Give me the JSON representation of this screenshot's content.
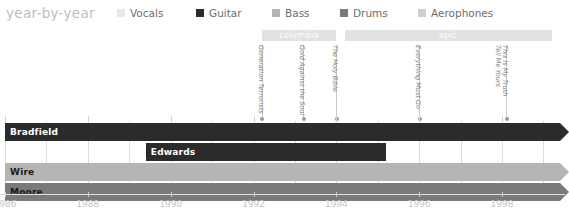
{
  "header": {
    "title": "year-by-year",
    "legend": [
      {
        "label": "Vocals",
        "color": "#e8e8e8",
        "x": 117
      },
      {
        "label": "Guitar",
        "color": "#2b2b2b",
        "x": 196
      },
      {
        "label": "Bass",
        "color": "#b5b5b5",
        "x": 272
      },
      {
        "label": "Drums",
        "color": "#7a7a7a",
        "x": 340
      },
      {
        "label": "Aerophones",
        "color": "#d0d0d0",
        "x": 418
      }
    ]
  },
  "chart_data": {
    "type": "bar",
    "title": "year-by-year",
    "xlabel": "",
    "ylabel": "",
    "xlim": [
      1986,
      1999.4
    ],
    "grid": true,
    "legend_position": "top",
    "x_ticks": [
      "1986",
      "1988",
      "1990",
      "1992",
      "1994",
      "1996",
      "1998"
    ],
    "x_tick_values": [
      1986,
      1988,
      1990,
      1992,
      1994,
      1996,
      1998
    ],
    "categories": [
      "Bradfield",
      "Edwards",
      "Wire",
      "Moore"
    ],
    "series": [
      {
        "name": "Bradfield",
        "instrument": "Guitar",
        "color": "#2b2b2b",
        "start": 1986.0,
        "end": 1999.4,
        "open_ended": true
      },
      {
        "name": "Edwards",
        "instrument": "Guitar",
        "color": "#2b2b2b",
        "start": 1989.4,
        "end": 1995.2,
        "open_ended": false
      },
      {
        "name": "Wire",
        "instrument": "Bass",
        "color": "#b5b5b5",
        "start": 1986.0,
        "end": 1999.4,
        "open_ended": true
      },
      {
        "name": "Moore",
        "instrument": "Drums",
        "color": "#7a7a7a",
        "start": 1986.0,
        "end": 1999.4,
        "open_ended": true
      }
    ],
    "label_bars": [
      {
        "label": "columbia",
        "start": 1992.2,
        "end": 1994.0
      },
      {
        "label": "epic",
        "start": 1994.2,
        "end": 1999.2
      }
    ],
    "albums": [
      {
        "title": "Generation Terrorists",
        "year": 1992.2,
        "lines": [
          "Generation Terrorists"
        ]
      },
      {
        "title": "Gold Against the Soul",
        "year": 1993.2,
        "lines": [
          "Gold Against the Soul"
        ]
      },
      {
        "title": "The Holy Bible",
        "year": 1994.0,
        "lines": [
          "The Holy Bible"
        ]
      },
      {
        "title": "Everything Must Go",
        "year": 1996.0,
        "lines": [
          "Everything Must Go"
        ]
      },
      {
        "title": "This Is My Truth Tell Me Yours",
        "year": 1998.1,
        "lines": [
          "This Is My Truth",
          "Tell Me Yours"
        ]
      }
    ]
  }
}
